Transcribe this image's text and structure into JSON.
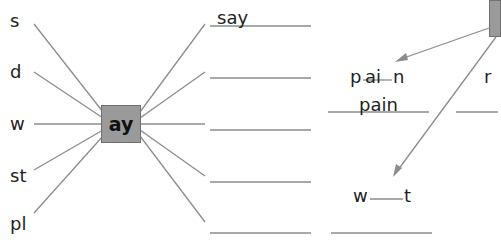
{
  "left_sheet": {
    "center_grapheme": "ay",
    "onsets": [
      "s",
      "d",
      "w",
      "st",
      "pl"
    ],
    "answers": [
      "say",
      "",
      "",
      "",
      ""
    ]
  },
  "right_sheet": {
    "words": [
      {
        "prefix": "p",
        "grapheme": "ai",
        "suffix": "n",
        "answer": "pain"
      },
      {
        "prefix": "r",
        "grapheme": "",
        "suffix": "",
        "answer": ""
      },
      {
        "prefix": "w",
        "grapheme": "",
        "suffix": "t",
        "answer": ""
      }
    ]
  },
  "colors": {
    "box": "#9a9a9a",
    "line": "#8a8a8a",
    "text": "#222222"
  }
}
